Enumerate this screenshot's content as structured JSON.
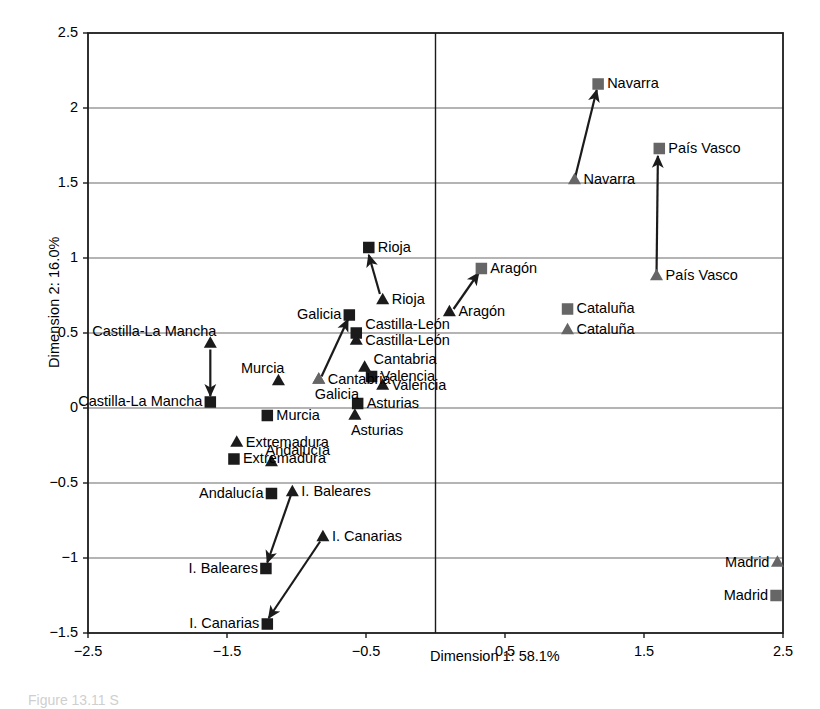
{
  "figure": {
    "caption": "Figure 13.11  S",
    "colors": {
      "dark": "#1b1b1b",
      "gray": "#666666",
      "grid": "#6b6b6b",
      "frame": "#1b1b1b"
    }
  },
  "chart_data": {
    "type": "scatter",
    "title": "",
    "xlabel": "Dimension 1: 58.1%",
    "ylabel": "Dimension 2: 16.0%",
    "xlim": [
      -2.5,
      2.5
    ],
    "ylim": [
      -1.5,
      2.5
    ],
    "xticks": [
      -2.5,
      -1.5,
      -0.5,
      0.5,
      1.5,
      2.5
    ],
    "xticklabels": [
      "−2.5",
      "−1.5",
      "−0.5",
      "0.5",
      "1.5",
      "2.5"
    ],
    "yticks": [
      -1.5,
      -1,
      -0.5,
      0,
      0.5,
      1,
      1.5,
      2,
      2.5
    ],
    "yticklabels": [
      "−1.5",
      "−1",
      "−0.5",
      "0",
      "0.5",
      "1",
      "1.5",
      "2",
      "2.5"
    ],
    "grid": "horizontal",
    "zero_line_x": 0,
    "legend": "none",
    "series": [
      {
        "name": "triangle-series",
        "marker": "triangle"
      },
      {
        "name": "square-series",
        "marker": "square"
      }
    ],
    "points": [
      {
        "region": "Navarra",
        "marker": "square",
        "color": "gray",
        "x": 1.17,
        "y": 2.16,
        "label": "Navarra",
        "label_pos": "right"
      },
      {
        "region": "Navarra",
        "marker": "triangle",
        "color": "gray",
        "x": 1.0,
        "y": 1.52,
        "label": "Navarra",
        "label_pos": "right"
      },
      {
        "region": "País Vasco",
        "marker": "square",
        "color": "gray",
        "x": 1.61,
        "y": 1.73,
        "label": "País Vasco",
        "label_pos": "right"
      },
      {
        "region": "País Vasco",
        "marker": "triangle",
        "color": "gray",
        "x": 1.59,
        "y": 0.88,
        "label": "País Vasco",
        "label_pos": "right"
      },
      {
        "region": "Rioja",
        "marker": "square",
        "color": "dark",
        "x": -0.48,
        "y": 1.07,
        "label": "Rioja",
        "label_pos": "right"
      },
      {
        "region": "Rioja",
        "marker": "triangle",
        "color": "dark",
        "x": -0.38,
        "y": 0.72,
        "label": "Rioja",
        "label_pos": "right"
      },
      {
        "region": "Aragón",
        "marker": "square",
        "color": "gray",
        "x": 0.33,
        "y": 0.93,
        "label": "Aragón",
        "label_pos": "right"
      },
      {
        "region": "Aragón",
        "marker": "triangle",
        "color": "dark",
        "x": 0.1,
        "y": 0.64,
        "label": "Aragón",
        "label_pos": "right"
      },
      {
        "region": "Cataluña",
        "marker": "square",
        "color": "gray",
        "x": 0.95,
        "y": 0.66,
        "label": "Cataluña",
        "label_pos": "right"
      },
      {
        "region": "Cataluña",
        "marker": "triangle",
        "color": "gray",
        "x": 0.95,
        "y": 0.52,
        "label": "Cataluña",
        "label_pos": "right"
      },
      {
        "region": "Galicia",
        "marker": "square",
        "color": "dark",
        "x": -0.62,
        "y": 0.62,
        "label": "Galicia",
        "label_pos": "left"
      },
      {
        "region": "Galicia",
        "marker": "triangle",
        "color": "gray",
        "x": -0.84,
        "y": 0.19,
        "label": "Galicia",
        "label_pos": "below"
      },
      {
        "region": "Castilla-León",
        "marker": "square",
        "color": "dark",
        "x": -0.57,
        "y": 0.5,
        "label": "Castilla-León",
        "label_pos": "right-up"
      },
      {
        "region": "Castilla-León",
        "marker": "triangle",
        "color": "dark",
        "x": -0.57,
        "y": 0.45,
        "label": "Castilla-León",
        "label_pos": "right"
      },
      {
        "region": "Cantabria",
        "marker": "triangle",
        "color": "dark",
        "x": -0.51,
        "y": 0.27,
        "label": "Cantabria",
        "label_pos": "right-up"
      },
      {
        "region": "Cantabria",
        "marker": "triangle",
        "color": "gray",
        "x": -0.84,
        "y": 0.19,
        "label": "Cantabria",
        "label_pos": "right"
      },
      {
        "region": "Valencia",
        "marker": "square",
        "color": "dark",
        "x": -0.46,
        "y": 0.21,
        "label": "Valencia",
        "label_pos": "right"
      },
      {
        "region": "Valencia",
        "marker": "triangle",
        "color": "dark",
        "x": -0.38,
        "y": 0.15,
        "label": "Valencia",
        "label_pos": "right"
      },
      {
        "region": "Asturias",
        "marker": "square",
        "color": "dark",
        "x": -0.56,
        "y": 0.03,
        "label": "Asturias",
        "label_pos": "right"
      },
      {
        "region": "Asturias",
        "marker": "triangle",
        "color": "dark",
        "x": -0.58,
        "y": -0.05,
        "label": "Asturias",
        "label_pos": "below"
      },
      {
        "region": "Castilla-La Mancha",
        "marker": "triangle",
        "color": "dark",
        "x": -1.62,
        "y": 0.43,
        "label": "Castilla-La Mancha",
        "label_pos": "above-left"
      },
      {
        "region": "Castilla-La Mancha",
        "marker": "square",
        "color": "dark",
        "x": -1.62,
        "y": 0.04,
        "label": "Castilla-La Mancha",
        "label_pos": "left"
      },
      {
        "region": "Murcia",
        "marker": "triangle",
        "color": "dark",
        "x": -1.13,
        "y": 0.18,
        "label": "Murcia",
        "label_pos": "above-left"
      },
      {
        "region": "Murcia",
        "marker": "square",
        "color": "dark",
        "x": -1.21,
        "y": -0.05,
        "label": "Murcia",
        "label_pos": "right"
      },
      {
        "region": "Extremadura",
        "marker": "triangle",
        "color": "dark",
        "x": -1.43,
        "y": -0.23,
        "label": "Extremadura",
        "label_pos": "right"
      },
      {
        "region": "Extremadura",
        "marker": "square",
        "color": "dark",
        "x": -1.45,
        "y": -0.34,
        "label": "Extremadura",
        "label_pos": "right"
      },
      {
        "region": "Andalucía",
        "marker": "triangle",
        "color": "dark",
        "x": -1.18,
        "y": -0.36,
        "label": "Andalucía",
        "label_pos": "above-right"
      },
      {
        "region": "Andalucía",
        "marker": "square",
        "color": "dark",
        "x": -1.18,
        "y": -0.57,
        "label": "Andalucía",
        "label_pos": "left"
      },
      {
        "region": "I. Baleares",
        "marker": "triangle",
        "color": "dark",
        "x": -1.03,
        "y": -0.56,
        "label": "I. Baleares",
        "label_pos": "right"
      },
      {
        "region": "I. Baleares",
        "marker": "square",
        "color": "dark",
        "x": -1.22,
        "y": -1.07,
        "label": "I. Baleares",
        "label_pos": "left"
      },
      {
        "region": "I. Canarias",
        "marker": "triangle",
        "color": "dark",
        "x": -0.81,
        "y": -0.86,
        "label": "I. Canarias",
        "label_pos": "right"
      },
      {
        "region": "I. Canarias",
        "marker": "square",
        "color": "dark",
        "x": -1.21,
        "y": -1.44,
        "label": "I. Canarias",
        "label_pos": "left"
      },
      {
        "region": "Madrid",
        "marker": "triangle",
        "color": "gray",
        "x": 2.46,
        "y": -1.03,
        "label": "Madrid",
        "label_pos": "left"
      },
      {
        "region": "Madrid",
        "marker": "square",
        "color": "gray",
        "x": 2.45,
        "y": -1.25,
        "label": "Madrid",
        "label_pos": "left"
      }
    ],
    "arrows": [
      {
        "region": "Navarra",
        "from": [
          1.0,
          1.52
        ],
        "to": [
          1.16,
          2.12
        ]
      },
      {
        "region": "País Vasco",
        "from": [
          1.59,
          0.88
        ],
        "to": [
          1.6,
          1.68
        ]
      },
      {
        "region": "Rioja",
        "from": [
          -0.4,
          0.76
        ],
        "to": [
          -0.48,
          1.02
        ]
      },
      {
        "region": "Aragón",
        "from": [
          0.13,
          0.66
        ],
        "to": [
          0.31,
          0.9
        ]
      },
      {
        "region": "Galicia",
        "from": [
          -0.82,
          0.21
        ],
        "to": [
          -0.63,
          0.59
        ]
      },
      {
        "region": "Castilla-La Mancha",
        "from": [
          -1.62,
          0.39
        ],
        "to": [
          -1.62,
          0.08
        ]
      },
      {
        "region": "I. Baleares",
        "from": [
          -1.04,
          -0.58
        ],
        "to": [
          -1.21,
          -1.03
        ]
      },
      {
        "region": "I. Canarias",
        "from": [
          -0.83,
          -0.89
        ],
        "to": [
          -1.2,
          -1.4
        ]
      }
    ]
  }
}
